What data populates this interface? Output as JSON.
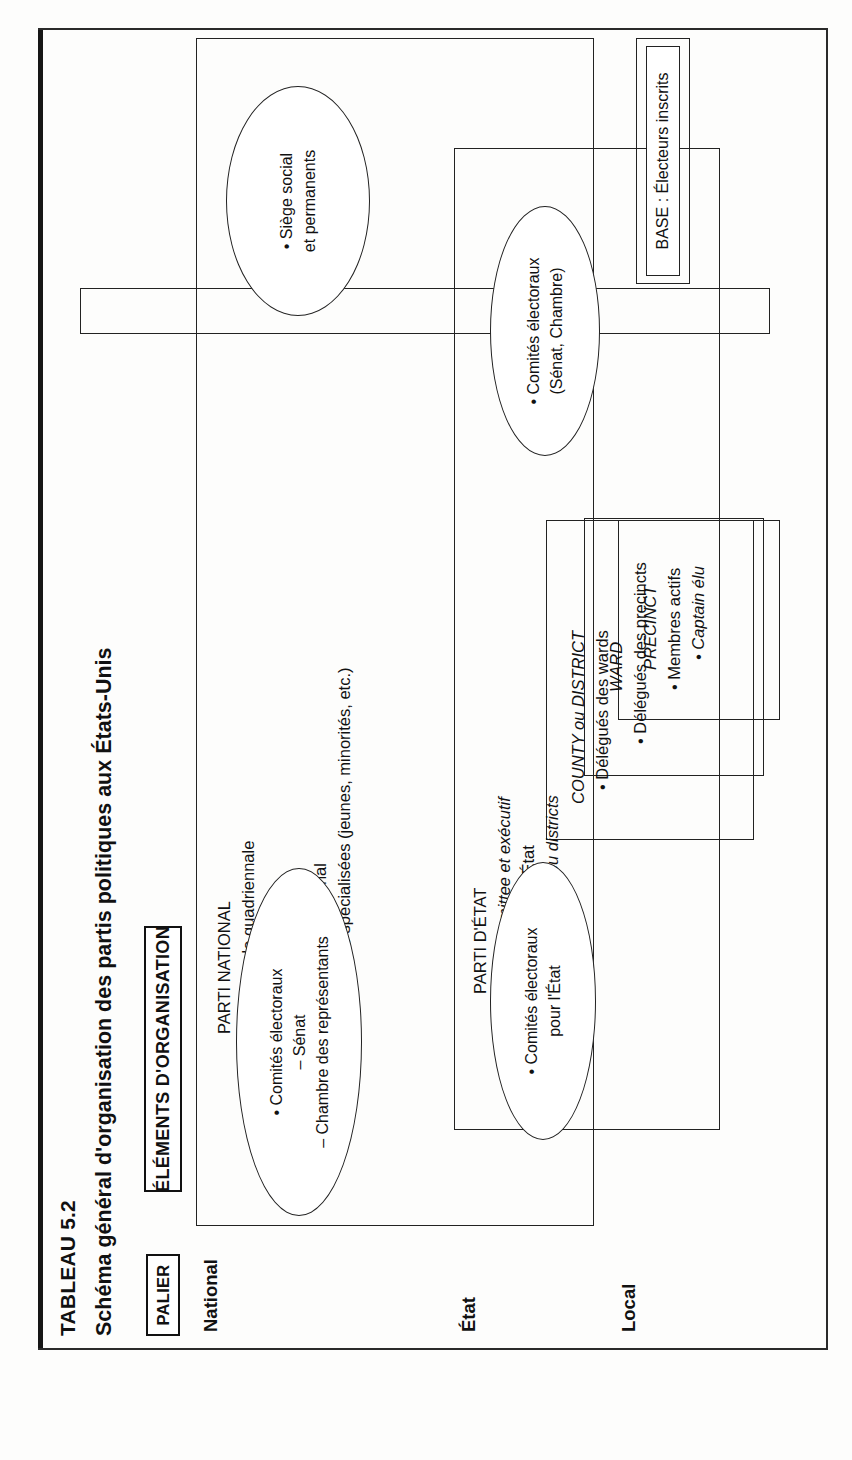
{
  "document": {
    "table_number": "TABLEAU 5.2",
    "title": "Schéma général d'organisation des partis politiques aux États-Unis"
  },
  "headers": {
    "palier": "PALIER",
    "elements": "ÉLÉMENTS D'ORGANISATION"
  },
  "tiers": [
    {
      "id": "national",
      "label": "National"
    },
    {
      "id": "etat",
      "label": "État"
    },
    {
      "id": "local",
      "label": "Local"
    }
  ],
  "blocks": {
    "parti_national": {
      "title": "PARTI NATIONAL",
      "items": [
        "• Convention nationale quadriennale",
        "• National Committee",
        "• National Executive",
        "• Présidence du parti national",
        "• Organisations nationales spécialisées (jeunes, minorités, etc.)"
      ],
      "italic_items": [
        "National Committee",
        "National Executive"
      ]
    },
    "parti_etat": {
      "title": "PARTI D'ÉTAT",
      "items": [
        "• State Central Committee et exécutif",
        "• Présidence du parti d'État",
        "• Délégués des counties ou districts"
      ]
    },
    "county": {
      "title": "COUNTY ou DISTRICT",
      "items": [
        "• Délégués des wards"
      ]
    },
    "ward": {
      "title": "WARD",
      "items": [
        "• Délégués des precincts"
      ]
    },
    "precinct": {
      "title": "PRECINCT",
      "items": [
        "• Membres actifs",
        "• Captain élu"
      ]
    }
  },
  "ovals": {
    "national_committees": {
      "lines": [
        "• Comités électoraux",
        "– Sénat",
        "– Chambre des représentants"
      ]
    },
    "headquarters": {
      "lines": [
        "• Siège social",
        "et permanents"
      ]
    },
    "congressional_committees": {
      "lines": [
        "• Comités électoraux",
        "(Sénat, Chambre)"
      ]
    },
    "state_committees": {
      "lines": [
        "• Comités électoraux",
        "pour l'État"
      ]
    }
  },
  "electorate": {
    "label": "ÉLECTORAT",
    "base": "BASE : Électeurs inscrits"
  }
}
